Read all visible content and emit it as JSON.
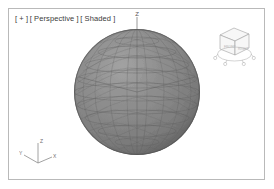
{
  "app": {
    "name": "3D Viewport",
    "background_color": "#ffffff",
    "border_color": "#b9b9b9"
  },
  "viewport": {
    "label_parts": [
      "[ + ]",
      "[ Perspective ]",
      "[ Shaded ]"
    ],
    "label_full": "[ + ] [ Perspective ] [ Shaded ]",
    "plus_label": "[ + ]",
    "view_label": "[ Perspective ]",
    "shading_label": "[ Shaded ]",
    "label_color": "#3a3a3a"
  },
  "scene": {
    "object_name": "GeoSphere",
    "axis_marker_label": "Z",
    "sphere": {
      "center_x": 135,
      "center_y": 91,
      "radius": 63,
      "fill_color": "#8b8b8b",
      "shadow_color": "#5d5d5d",
      "highlight_color": "#a6a6a6",
      "wire_color": "#5a5a5a",
      "segments": 10
    },
    "axis_line_color": "#5a5a5a"
  },
  "tripod": {
    "title": "axis-tripod",
    "axes": [
      {
        "name": "Z",
        "label": "Z",
        "color": "#777777"
      },
      {
        "name": "Y",
        "label": "Y",
        "color": "#777777"
      },
      {
        "name": "X",
        "label": "X",
        "color": "#777777"
      }
    ],
    "z_label": "Z",
    "y_label": "Y",
    "x_label": "X"
  },
  "viewcube": {
    "title": "view-cube",
    "front_face_label": "FRONT",
    "right_face_label": "RIGHT",
    "top_face_label": "TOP",
    "line_color": "#9a9a9a",
    "face_color": "#f4f4f4"
  }
}
